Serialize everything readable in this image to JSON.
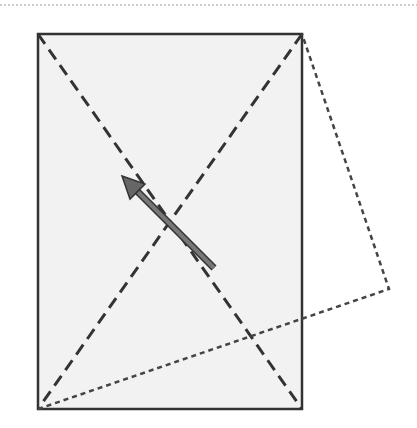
{
  "diagram": {
    "colors": {
      "background": "#ffffff",
      "rect_fill": "#f2f2f2",
      "stroke": "#333333",
      "top_border": "#888888",
      "arrow_fill": "#666666"
    },
    "top_border": {
      "y": 5,
      "x1": 0,
      "x2": 417,
      "style": "dotted"
    },
    "rectangle": {
      "x": 38,
      "y": 34,
      "width": 264,
      "height": 375,
      "style": "solid"
    },
    "diagonals": [
      {
        "x1": 38,
        "y1": 34,
        "x2": 302,
        "y2": 409,
        "style": "dashed"
      },
      {
        "x1": 302,
        "y1": 34,
        "x2": 38,
        "y2": 409,
        "style": "dashed"
      }
    ],
    "rotated_outline": {
      "points": [
        [
          38,
          409
        ],
        [
          302,
          34
        ],
        [
          389,
          289
        ]
      ],
      "style": "dotted"
    },
    "arrow": {
      "tail": [
        214,
        268
      ],
      "head": [
        122,
        176
      ],
      "direction": "up-left"
    }
  }
}
